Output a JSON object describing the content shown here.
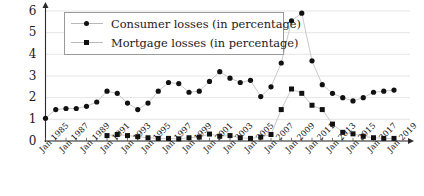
{
  "chart_data": {
    "type": "line",
    "title": "",
    "xlabel": "",
    "ylabel": "",
    "ylim": [
      0,
      6
    ],
    "yticks": [
      0,
      1,
      2,
      3,
      4,
      5,
      6
    ],
    "grid": true,
    "legend_position": "top-left",
    "x_tick_labels": [
      "Jan 1985",
      "Jan 1987",
      "Jan 1989",
      "Jan 1991",
      "Jan 1993",
      "Jan 1995",
      "Jan 1997",
      "Jan 1999",
      "Jan 2001",
      "Jan 2003",
      "Jan 2005",
      "Jan 2007",
      "Jan 2009",
      "Jan 2011",
      "Jan 2013",
      "Jan 2015",
      "Jan 2017",
      "Jan 2019"
    ],
    "x": [
      1985,
      1986,
      1987,
      1988,
      1989,
      1990,
      1991,
      1992,
      1993,
      1994,
      1995,
      1996,
      1997,
      1998,
      1999,
      2000,
      2001,
      2002,
      2003,
      2004,
      2005,
      2006,
      2007,
      2008,
      2009,
      2010,
      2011,
      2012,
      2013,
      2014,
      2015,
      2016,
      2017,
      2018,
      2019
    ],
    "series": [
      {
        "name": "Consumer losses (in percentage)",
        "marker": "circle",
        "color": "#111111",
        "x": [
          1985,
          1986,
          1987,
          1988,
          1989,
          1990,
          1991,
          1992,
          1993,
          1994,
          1995,
          1996,
          1997,
          1998,
          1999,
          2000,
          2001,
          2002,
          2003,
          2004,
          2005,
          2006,
          2007,
          2008,
          2009,
          2010,
          2011,
          2012,
          2013,
          2014,
          2015,
          2016,
          2017,
          2018,
          2019
        ],
        "values": [
          1.05,
          1.45,
          1.5,
          1.5,
          1.6,
          1.8,
          2.3,
          2.2,
          1.75,
          1.45,
          1.75,
          2.3,
          2.7,
          2.65,
          2.25,
          2.3,
          2.75,
          3.2,
          2.9,
          2.7,
          2.8,
          2.05,
          2.5,
          3.6,
          5.55,
          5.9,
          3.7,
          2.6,
          2.2,
          2.0,
          1.85,
          2.0,
          2.25,
          2.3,
          2.35
        ]
      },
      {
        "name": "Mortgage losses (in percentage)",
        "marker": "square",
        "color": "#111111",
        "x": [
          1991,
          1992,
          1993,
          1994,
          1995,
          1996,
          1997,
          1998,
          1999,
          2000,
          2001,
          2002,
          2003,
          2004,
          2005,
          2006,
          2007,
          2008,
          2009,
          2010,
          2011,
          2012,
          2013,
          2014,
          2015,
          2016,
          2017,
          2018,
          2019
        ],
        "values": [
          0.25,
          0.3,
          0.25,
          0.2,
          0.15,
          0.12,
          0.12,
          0.1,
          0.15,
          0.18,
          0.32,
          0.22,
          0.25,
          0.15,
          0.12,
          0.18,
          0.3,
          1.45,
          2.4,
          2.2,
          1.65,
          1.45,
          0.78,
          0.4,
          0.33,
          0.22,
          0.15,
          0.12,
          0.12
        ]
      }
    ]
  },
  "legend": {
    "items": [
      {
        "label": "Consumer losses (in percentage)",
        "marker": "circle-marker"
      },
      {
        "label": "Mortgage losses (in percentage)",
        "marker": "square-marker"
      }
    ]
  },
  "axes": {
    "y_labels": [
      "0",
      "1",
      "2",
      "3",
      "4",
      "5",
      "6"
    ]
  }
}
